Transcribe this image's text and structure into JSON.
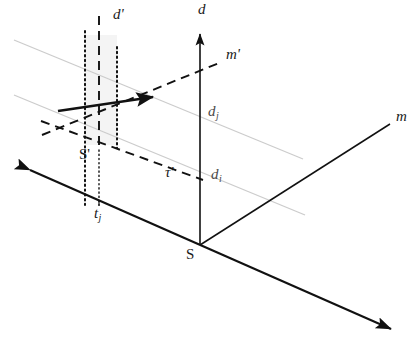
{
  "figure": {
    "type": "3d-axis-schematic",
    "title": "",
    "background_color": "#ffffff",
    "width": 415,
    "height": 343
  },
  "colors": {
    "axis": "#111111",
    "dashed": "#111111",
    "dotted": "#111111",
    "gray_line": "#c9c9c9",
    "band_fill": "#f2f2f2",
    "label": "#1a1a1a",
    "label_gray": "#4a4a4a"
  },
  "axes": [
    {
      "id": "d-axis",
      "label": "d",
      "label_x": 198,
      "label_y": 4,
      "style": "solid",
      "arrow": "start",
      "from": [
        200,
        245
      ],
      "to": [
        200,
        30
      ]
    },
    {
      "id": "m-axis",
      "label": "m",
      "label_x": 396,
      "label_y": 110,
      "style": "solid",
      "arrow": "none",
      "from": [
        200,
        245
      ],
      "to": [
        390,
        124
      ]
    },
    {
      "id": "t-axis",
      "label": "",
      "label_x": 0,
      "label_y": 0,
      "style": "solid",
      "arrow": "both",
      "from": [
        25,
        168
      ],
      "to": [
        396,
        331
      ]
    }
  ],
  "primed_axes": [
    {
      "id": "d-prime-axis",
      "label": "d'",
      "label_x": 113,
      "label_y": 8,
      "style": "dashed",
      "from": [
        99,
        16
      ],
      "to": [
        99,
        150
      ]
    },
    {
      "id": "m-prime-axis",
      "label": "m'",
      "label_x": 226,
      "label_y": 48,
      "style": "dashed",
      "from": [
        42,
        135
      ],
      "to": [
        219,
        63
      ]
    },
    {
      "id": "tau-prime-axis",
      "label": "τ'",
      "label_x": 165,
      "label_y": 166,
      "style": "dashed",
      "from": [
        41,
        121
      ],
      "to": [
        203,
        180
      ]
    }
  ],
  "points": [
    {
      "id": "origin-S",
      "label": "S",
      "label_x": 186,
      "label_y": 248,
      "x": 200,
      "y": 245,
      "upright": true
    },
    {
      "id": "origin-S-prime",
      "label": "S'",
      "label_x": 79,
      "label_y": 148,
      "x": 99,
      "y": 143,
      "upright": true
    }
  ],
  "ticks": [
    {
      "id": "tick-tj",
      "label": "t",
      "sub": "j",
      "label_x": 94,
      "label_y": 207,
      "axis": "t-axis",
      "x": 99,
      "y": 203
    },
    {
      "id": "tick-dj",
      "label": "d",
      "sub": "j",
      "label_x": 208,
      "label_y": 105,
      "axis": "d-axis",
      "x": 200,
      "y": 113
    },
    {
      "id": "tick-di",
      "label": "d",
      "sub": "i",
      "label_x": 211,
      "label_y": 168,
      "axis": "d-axis",
      "x": 200,
      "y": 176
    }
  ],
  "gray_depth_lines": [
    {
      "id": "depth-line-dj",
      "from": [
        14,
        40
      ],
      "to": [
        303,
        159
      ]
    },
    {
      "id": "depth-line-di",
      "from": [
        14,
        95
      ],
      "to": [
        305,
        215
      ]
    }
  ],
  "vertical_reference_lines": [
    {
      "id": "dotted-line-left",
      "style": "dotted",
      "from": [
        85,
        31
      ],
      "to": [
        85,
        205
      ]
    },
    {
      "id": "dashed-line-center",
      "style": "dashed",
      "from": [
        99,
        16
      ],
      "to": [
        99,
        150
      ]
    },
    {
      "id": "dotted-line-right",
      "style": "dotted",
      "from": [
        117,
        47
      ],
      "to": [
        117,
        148
      ]
    }
  ],
  "shaded_band": {
    "id": "vertical-band",
    "x": 85,
    "y": 35,
    "width": 32,
    "height": 110
  },
  "vector_arrow": {
    "id": "bold-vector-arrow",
    "from": [
      58,
      111
    ],
    "to": [
      158,
      96
    ],
    "arrow": "end",
    "width": 2.6
  },
  "dashed_construction_lines": [
    {
      "id": "dash-lower-left-edge",
      "from": [
        41,
        121
      ],
      "to": [
        203,
        180
      ]
    },
    {
      "id": "dash-upper-left-edge",
      "from": [
        42,
        135
      ],
      "to": [
        219,
        63
      ]
    }
  ]
}
